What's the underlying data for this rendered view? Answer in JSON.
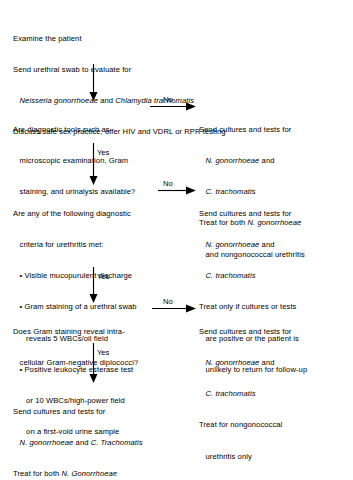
{
  "diagram": {
    "type": "clinical-decision-flowchart",
    "ink_color": "#000000",
    "background_color": "#ffffff"
  },
  "nodes": {
    "start": {
      "kind": "process",
      "lines": [
        "Examine the patient",
        "Send urethral swab to evaluate for",
        "   Neisseria gonorrhoeae and Chlamydia trachomatis",
        "Discuss safe sex practice; offer HIV and VDRL or RPR testing"
      ],
      "line_1": "Examine the patient",
      "line_2": "Send urethral swab to evaluate for",
      "line_3_pre": "   ",
      "line_3_italic_a": "Neisseria gonorrhoeae",
      "line_3_mid": " and ",
      "line_3_italic_b": "Chlamydia trachomatis",
      "line_4": "Discuss safe sex practice; offer HIV and VDRL or RPR testing"
    },
    "decision_1": {
      "kind": "decision",
      "line_1": "Are diagnostic tools such as",
      "line_2": "   microscopic examination, Gram",
      "line_3": "   staining, and urinalysis available?"
    },
    "decision_2": {
      "kind": "decision",
      "line_1": "Are any of the following diagnostic",
      "line_2": "   criteria for urethritis met:",
      "bullet_1": "   • Visible mucopurulent discharge",
      "bullet_2": "   • Gram staining of a urethral swab",
      "bullet_2_cont": "      reveals 5 WBCs/oil field",
      "bullet_3": "   • Positive leukocyte esterase test",
      "bullet_3_cont_a": "      or 10 WBCs/high-power field",
      "bullet_3_cont_b": "      on a first-void urine sample"
    },
    "decision_3": {
      "kind": "decision",
      "line_1": "Does Gram staining reveal intra-",
      "line_2": "   cellular Gram-negative diplococci?"
    },
    "outcome_1": {
      "kind": "process",
      "line_1": "Send cultures and tests for",
      "line_2_pre": "   ",
      "line_2_italic": "N. gonorrhoeae",
      "line_2_post": " and",
      "line_3_pre": "   ",
      "line_3_italic": "C. trachomatis",
      "line_4_pre": "Treat for both ",
      "line_4_italic": "N. gonorrhoeae",
      "line_5": "   and nongonococcal urethritis"
    },
    "outcome_2": {
      "kind": "process",
      "line_1": "Send cultures and tests for",
      "line_2_pre": "   ",
      "line_2_italic": "N. gonorrhoeae",
      "line_2_post": " and",
      "line_3_pre": "   ",
      "line_3_italic": "C. trachomatis",
      "line_4": "Treat only if cultures or tests",
      "line_5": "   are positve or the patient is",
      "line_6": "   unlikely to return for follow-up"
    },
    "outcome_3": {
      "kind": "process",
      "line_1": "Send cultures and tests for",
      "line_2_pre": "   ",
      "line_2_italic": "N. gonorrhoeae",
      "line_2_post": " and",
      "line_3_pre": "   ",
      "line_3_italic": "C. trachomatis",
      "line_4": "Treat for nongonococcal",
      "line_5": "   urethritis only"
    },
    "final": {
      "kind": "process",
      "line_1": "Send cultures and tests for",
      "line_2_pre": "   ",
      "line_2_italic_a": "N. gonorrhoeae",
      "line_2_mid": " and ",
      "line_2_italic_b": "C. Trachomatis",
      "line_3_pre": "Treat for both ",
      "line_3_italic": "N. Gonorrhoeae"
    }
  },
  "edges": {
    "start_to_decision_1": {
      "label": ""
    },
    "decision_1_no": {
      "label": "No"
    },
    "decision_1_yes": {
      "label": "Yes"
    },
    "decision_2_no": {
      "label": "No"
    },
    "decision_2_yes": {
      "label": "Yes"
    },
    "decision_3_no": {
      "label": "No"
    },
    "decision_3_yes": {
      "label": "Yes"
    }
  }
}
